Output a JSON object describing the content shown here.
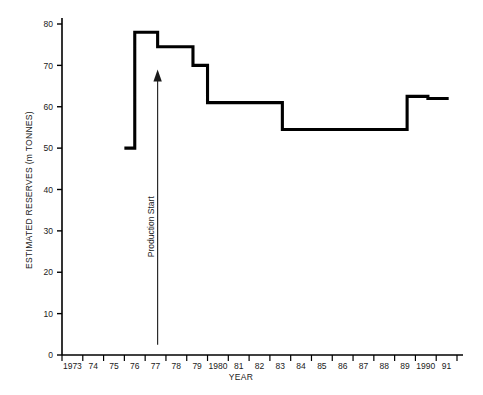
{
  "chart_data": {
    "type": "line",
    "subtype": "step",
    "title": "",
    "xlabel": "YEAR",
    "ylabel": "ESTIMATED RESERVES (m TONNES)",
    "xlim": [
      1973,
      1992
    ],
    "ylim": [
      0,
      80
    ],
    "ytick_values": [
      0,
      10,
      20,
      30,
      40,
      50,
      60,
      70,
      80
    ],
    "ytick_labels": [
      "0",
      "10",
      "20",
      "30",
      "40",
      "50",
      "60",
      "70",
      "80"
    ],
    "xtick_labels": [
      "1973",
      "74",
      "75",
      "76",
      "77",
      "78",
      "79",
      "1980",
      "81",
      "82",
      "83",
      "84",
      "85",
      "86",
      "87",
      "88",
      "89",
      "1990",
      "91"
    ],
    "xtick_values": [
      1973,
      1974,
      1975,
      1976,
      1977,
      1978,
      1979,
      1980,
      1981,
      1982,
      1983,
      1984,
      1985,
      1986,
      1987,
      1988,
      1989,
      1990,
      1991
    ],
    "grid": false,
    "legend": false,
    "series": [
      {
        "name": "Estimated Reserves",
        "color": "#000000",
        "steps": [
          {
            "x_start": 1976.0,
            "x_end": 1976.5,
            "value": 50.0
          },
          {
            "x_start": 1976.5,
            "x_end": 1977.6,
            "value": 78.0
          },
          {
            "x_start": 1977.6,
            "x_end": 1979.3,
            "value": 74.5
          },
          {
            "x_start": 1979.3,
            "x_end": 1980.0,
            "value": 70.0
          },
          {
            "x_start": 1980.0,
            "x_end": 1983.6,
            "value": 61.0
          },
          {
            "x_start": 1983.6,
            "x_end": 1989.6,
            "value": 54.5
          },
          {
            "x_start": 1989.6,
            "x_end": 1990.6,
            "value": 62.5
          },
          {
            "x_start": 1990.6,
            "x_end": 1991.6,
            "value": 62.0
          }
        ]
      }
    ],
    "annotations": [
      {
        "name": "production-start-arrow",
        "text": "Production Start",
        "x": 1977.6,
        "y_from": 2.5,
        "y_to": 69.0,
        "orientation": "vertical",
        "arrow": "up"
      }
    ]
  },
  "axes": {
    "y_title": "ESTIMATED RESERVES (m TONNES)",
    "x_title": "YEAR"
  },
  "colors": {
    "line": "#000000",
    "axis": "#000000",
    "text": "#1a1a1a",
    "background": "#ffffff"
  }
}
